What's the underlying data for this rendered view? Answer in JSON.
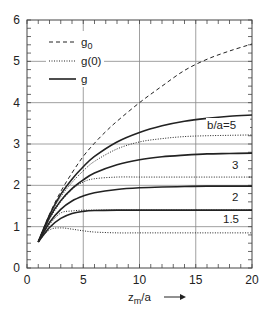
{
  "chart_data": {
    "type": "line",
    "title": "",
    "xlabel": "z_m/a",
    "ylabel": "",
    "xlim": [
      0,
      20
    ],
    "ylim": [
      0,
      6
    ],
    "x_ticks": [
      0,
      5,
      10,
      15,
      20
    ],
    "y_ticks": [
      0,
      1,
      2,
      3,
      4,
      5,
      6
    ],
    "grid": true,
    "legend": {
      "position": "upper-left",
      "entries": [
        {
          "label": "g0",
          "style": "dashed"
        },
        {
          "label": "g(0)",
          "style": "dotted"
        },
        {
          "label": "g",
          "style": "solid"
        }
      ]
    },
    "annotations": [
      "b/a=5",
      "3",
      "2",
      "1.5"
    ],
    "series": [
      {
        "name": "g0",
        "style": "dashed",
        "x": [
          1,
          2,
          3,
          4,
          5,
          6,
          7,
          8,
          10,
          12,
          14,
          16,
          18,
          20
        ],
        "y": [
          0.63,
          1.3,
          1.85,
          2.3,
          2.7,
          3.02,
          3.3,
          3.55,
          4.0,
          4.4,
          4.78,
          5.05,
          5.25,
          5.42
        ]
      },
      {
        "name": "g b/a=5",
        "style": "solid",
        "x": [
          1,
          2,
          3,
          4,
          5,
          6,
          8,
          10,
          12,
          14,
          16,
          18,
          20
        ],
        "y": [
          0.63,
          1.28,
          1.78,
          2.15,
          2.45,
          2.7,
          3.05,
          3.28,
          3.44,
          3.55,
          3.62,
          3.67,
          3.7
        ]
      },
      {
        "name": "g(0) b/a=5",
        "style": "dotted",
        "x": [
          1,
          2,
          3,
          4,
          5,
          6,
          8,
          10,
          12,
          14,
          16,
          18,
          20
        ],
        "y": [
          0.63,
          1.26,
          1.72,
          2.07,
          2.35,
          2.58,
          2.88,
          3.05,
          3.13,
          3.18,
          3.2,
          3.21,
          3.22
        ]
      },
      {
        "name": "g b/a=3",
        "style": "solid",
        "x": [
          1,
          2,
          3,
          4,
          5,
          6,
          8,
          10,
          12,
          14,
          16,
          18,
          20
        ],
        "y": [
          0.63,
          1.22,
          1.63,
          1.92,
          2.13,
          2.3,
          2.5,
          2.62,
          2.69,
          2.73,
          2.76,
          2.77,
          2.78
        ]
      },
      {
        "name": "g(0) b/a=3",
        "style": "dotted",
        "x": [
          1,
          2,
          3,
          4,
          5,
          6,
          8,
          10,
          12,
          14,
          16,
          18,
          20
        ],
        "y": [
          0.63,
          1.18,
          1.6,
          1.9,
          2.08,
          2.16,
          2.2,
          2.2,
          2.2,
          2.2,
          2.2,
          2.2,
          2.2
        ]
      },
      {
        "name": "g b/a=2",
        "style": "solid",
        "x": [
          1,
          2,
          3,
          4,
          5,
          6,
          8,
          10,
          12,
          14,
          16,
          18,
          20
        ],
        "y": [
          0.63,
          1.1,
          1.42,
          1.62,
          1.74,
          1.82,
          1.9,
          1.94,
          1.96,
          1.97,
          1.98,
          1.98,
          1.98
        ]
      },
      {
        "name": "g(0) b/a=2",
        "style": "dotted",
        "x": [
          1,
          2,
          3,
          4,
          5,
          6,
          8,
          10,
          12,
          14,
          16,
          18,
          20
        ],
        "y": [
          0.63,
          1.05,
          1.33,
          1.38,
          1.4,
          1.4,
          1.4,
          1.4,
          1.4,
          1.4,
          1.4,
          1.4,
          1.4
        ]
      },
      {
        "name": "g b/a=1.5",
        "style": "solid",
        "x": [
          1,
          2,
          3,
          4,
          5,
          6,
          8,
          10,
          12,
          14,
          16,
          18,
          20
        ],
        "y": [
          0.63,
          0.98,
          1.2,
          1.32,
          1.37,
          1.39,
          1.4,
          1.4,
          1.4,
          1.4,
          1.4,
          1.4,
          1.4
        ]
      },
      {
        "name": "g(0) b/a=1.5",
        "style": "dotted",
        "x": [
          1,
          2,
          3,
          4,
          5,
          6,
          8,
          10,
          12,
          14,
          16,
          18,
          20
        ],
        "y": [
          0.63,
          0.92,
          0.97,
          0.94,
          0.9,
          0.87,
          0.85,
          0.85,
          0.85,
          0.85,
          0.85,
          0.85,
          0.85
        ]
      }
    ]
  },
  "legend_labels": {
    "g0": "g",
    "g0_sub": "0",
    "g_zero": "g(0)",
    "g": "g"
  },
  "axis": {
    "xlabel_main": "z",
    "xlabel_sub": "m",
    "xlabel_tail": "/a",
    "arrow": "⟶"
  },
  "annot": {
    "ba5": "b/a=5",
    "ba3": "3",
    "ba2": "2",
    "ba15": "1.5"
  }
}
